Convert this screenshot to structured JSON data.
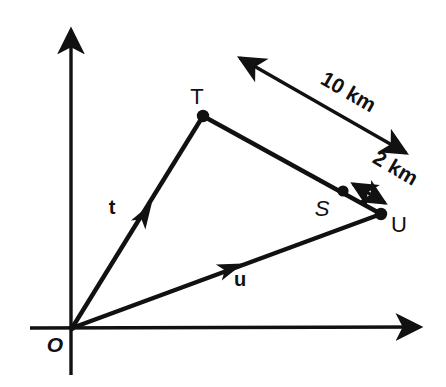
{
  "figure": {
    "type": "vector-diagram",
    "background_color": "#ffffff",
    "stroke_color": "#111111",
    "axes": {
      "x_axis": {
        "name": "x-axis",
        "from": [
          30,
          328
        ],
        "to": [
          425,
          327
        ],
        "arrow": "end"
      },
      "y_axis": {
        "name": "y-axis",
        "from": [
          71,
          375
        ],
        "to": [
          71,
          24
        ],
        "arrow": "end"
      }
    },
    "origin_label": "O",
    "points": [
      {
        "id": "T",
        "label": "T",
        "x": 203,
        "y": 116,
        "label_x": 197,
        "label_y": 104
      },
      {
        "id": "S",
        "label": "S",
        "x": 343,
        "y": 191,
        "label_x": 322,
        "label_y": 216
      },
      {
        "id": "U",
        "label": "U",
        "x": 381,
        "y": 214,
        "label_x": 391,
        "label_y": 232
      }
    ],
    "vectors": [
      {
        "id": "t",
        "label": "t",
        "from": [
          72,
          328
        ],
        "to": [
          203,
          116
        ],
        "label_x": 112,
        "label_y": 214
      },
      {
        "id": "u",
        "label": "u",
        "from": [
          72,
          328
        ],
        "to": [
          381,
          214
        ],
        "label_x": 238,
        "label_y": 285
      }
    ],
    "segments": [
      {
        "id": "TU",
        "from": [
          203,
          116
        ],
        "to": [
          381,
          214
        ]
      }
    ],
    "dimensions": [
      {
        "id": "dim-10km",
        "label": "10 km",
        "from": [
          234,
          55
        ],
        "to": [
          412,
          157
        ],
        "double_headed": true,
        "label_x": 345,
        "label_y": 96,
        "label_rotation": 30
      },
      {
        "id": "dim-2km",
        "label": "2 km",
        "from": [
          348,
          181
        ],
        "to": [
          390,
          206
        ],
        "double_headed": true,
        "label_x": 392,
        "label_y": 172,
        "label_rotation": 30
      }
    ]
  }
}
